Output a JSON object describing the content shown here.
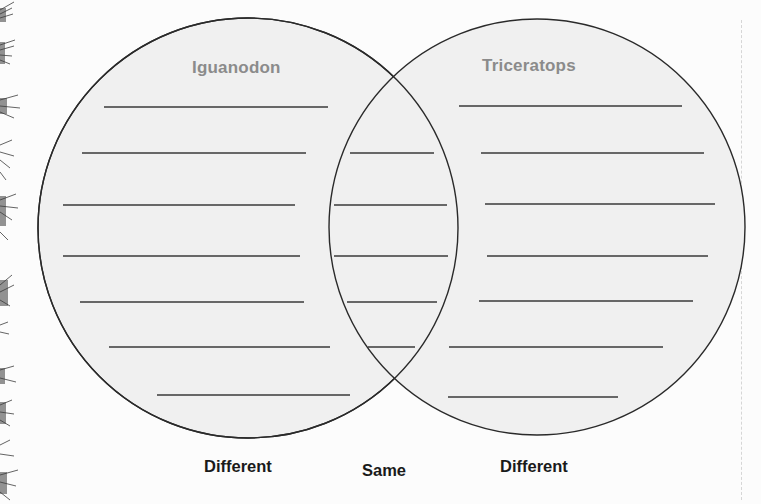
{
  "diagram": {
    "type": "venn",
    "left_circle": {
      "title": "Iguanodon",
      "cx": 248,
      "cy": 228,
      "r": 210,
      "writing_lines": [
        {
          "x1": 104,
          "x2": 328,
          "y": 107
        },
        {
          "x1": 82,
          "x2": 306,
          "y": 153
        },
        {
          "x1": 63,
          "x2": 295,
          "y": 205
        },
        {
          "x1": 63,
          "x2": 300,
          "y": 256
        },
        {
          "x1": 80,
          "x2": 304,
          "y": 302
        },
        {
          "x1": 109,
          "x2": 330,
          "y": 347
        },
        {
          "x1": 157,
          "x2": 350,
          "y": 395
        }
      ]
    },
    "right_circle": {
      "title": "Triceratops",
      "cx": 537,
      "cy": 227,
      "r": 208,
      "writing_lines": [
        {
          "x1": 459,
          "x2": 682,
          "y": 106
        },
        {
          "x1": 481,
          "x2": 704,
          "y": 153
        },
        {
          "x1": 485,
          "x2": 715,
          "y": 204
        },
        {
          "x1": 487,
          "x2": 708,
          "y": 256
        },
        {
          "x1": 479,
          "x2": 693,
          "y": 301
        },
        {
          "x1": 449,
          "x2": 663,
          "y": 347
        },
        {
          "x1": 448,
          "x2": 618,
          "y": 397
        }
      ]
    },
    "overlap": {
      "writing_lines": [
        {
          "x1": 350,
          "x2": 434,
          "y": 153
        },
        {
          "x1": 334,
          "x2": 447,
          "y": 205
        },
        {
          "x1": 334,
          "x2": 448,
          "y": 256
        },
        {
          "x1": 347,
          "x2": 437,
          "y": 302
        },
        {
          "x1": 368,
          "x2": 415,
          "y": 347
        }
      ]
    },
    "bottom_labels": {
      "left": "Different",
      "middle": "Same",
      "right": "Different"
    }
  },
  "colors": {
    "circle_fill": "#f0f0f0",
    "circle_stroke": "#2a2a2a",
    "line_color": "#3a3a3a",
    "title_color": "#8b8b8b",
    "label_color": "#1a1a1a",
    "background": "#fcfcfc"
  },
  "decorations": {
    "left_border": "pine-branch-border-icon"
  }
}
